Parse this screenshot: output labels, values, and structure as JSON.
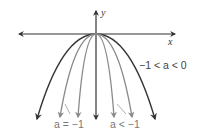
{
  "diagram": {
    "type": "family of downward parabolas y = ax^2 with a < 0",
    "axes": {
      "x_label": "x",
      "y_label": "y"
    },
    "labels": {
      "outer": "−1 < a < 0",
      "middle": "a = −1",
      "inner": "a < −1"
    },
    "colors": {
      "dark": "#333333",
      "gray": "#8a8a8a",
      "axis": "#333333"
    },
    "curves": [
      {
        "name": "outer",
        "condition": "−1 < a < 0",
        "color": "dark"
      },
      {
        "name": "middle",
        "condition": "a = −1",
        "color": "gray"
      },
      {
        "name": "inner",
        "condition": "a < −1",
        "color": "gray"
      }
    ]
  }
}
